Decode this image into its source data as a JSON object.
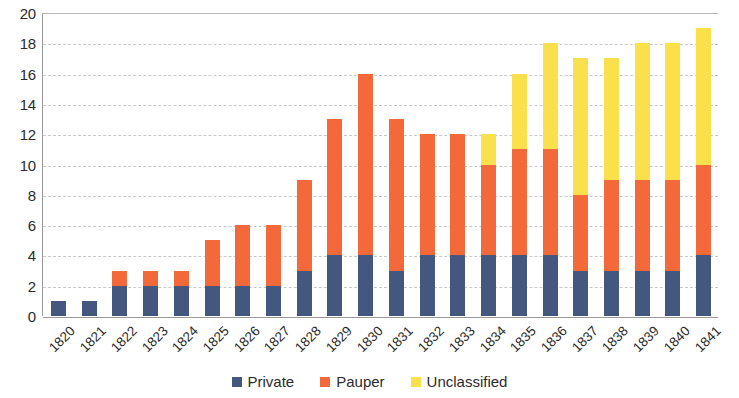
{
  "chart_data": {
    "type": "bar",
    "title": "",
    "subtitle": "",
    "xlabel": "",
    "ylabel": "",
    "stacked": true,
    "grid": true,
    "legend_position": "bottom",
    "ylim": [
      0,
      20
    ],
    "ytick_step": 2,
    "y_ticks": [
      "20",
      "18",
      "16",
      "14",
      "12",
      "10",
      "8",
      "6",
      "4",
      "2",
      "0"
    ],
    "categories": [
      "1820",
      "1821",
      "1822",
      "1823",
      "1824",
      "1825",
      "1826",
      "1827",
      "1828",
      "1829",
      "1830",
      "1831",
      "1832",
      "1833",
      "1834",
      "1835",
      "1836",
      "1837",
      "1838",
      "1839",
      "1840",
      "1841"
    ],
    "series": [
      {
        "name": "Private",
        "color": "#44587f",
        "values": [
          1,
          1,
          2,
          2,
          2,
          2,
          2,
          2,
          3,
          4,
          4,
          3,
          4,
          4,
          4,
          4,
          4,
          3,
          3,
          3,
          3,
          4
        ]
      },
      {
        "name": "Pauper",
        "color": "#f4693a",
        "values": [
          0,
          0,
          1,
          1,
          1,
          3,
          4,
          4,
          6,
          9,
          12,
          10,
          8,
          8,
          6,
          7,
          7,
          5,
          6,
          6,
          6,
          6
        ]
      },
      {
        "name": "Unclassified",
        "color": "#fae14b",
        "values": [
          0,
          0,
          0,
          0,
          0,
          0,
          0,
          0,
          0,
          0,
          0,
          0,
          0,
          0,
          2,
          5,
          7,
          9,
          8,
          9,
          9,
          9
        ]
      }
    ],
    "totals": [
      1,
      1,
      3,
      3,
      3,
      5,
      6,
      6,
      9,
      13,
      16,
      13,
      12,
      12,
      12,
      16,
      18,
      17,
      17,
      18,
      18,
      19
    ]
  },
  "legend": {
    "items": [
      {
        "label": "Private",
        "color": "#44587f"
      },
      {
        "label": "Pauper",
        "color": "#f4693a"
      },
      {
        "label": "Unclassified",
        "color": "#fae14b"
      }
    ]
  }
}
